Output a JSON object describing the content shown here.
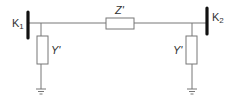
{
  "diagram": {
    "type": "pi-equivalent circuit",
    "nodes": [
      {
        "id": "K1",
        "label": "K",
        "subscript": "1"
      },
      {
        "id": "K2",
        "label": "K",
        "subscript": "2"
      }
    ],
    "series_impedance": {
      "label": "Z'"
    },
    "shunt_left": {
      "label": "Y'"
    },
    "shunt_right": {
      "label": "Y'"
    },
    "colors": {
      "line": "#666666",
      "bus": "#111111",
      "box": "#666666"
    }
  }
}
